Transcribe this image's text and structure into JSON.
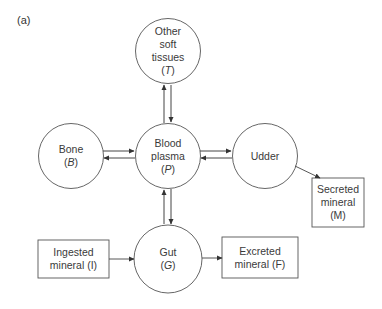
{
  "panel_label": "(a)",
  "compartments": {
    "tissues": {
      "lines": [
        "Other",
        "soft",
        "tissues"
      ],
      "symbol": "T"
    },
    "bone": {
      "lines": [
        "Bone"
      ],
      "symbol": "B"
    },
    "plasma": {
      "lines": [
        "Blood",
        "plasma"
      ],
      "symbol": "P"
    },
    "udder": {
      "lines": [
        "Udder"
      ],
      "symbol": ""
    },
    "gut": {
      "lines": [
        "Gut"
      ],
      "symbol": "G"
    }
  },
  "boxes": {
    "secreted": {
      "lines": [
        "Secreted",
        "mineral",
        "(M)"
      ]
    },
    "ingested": {
      "lines": [
        "Ingested",
        "mineral (I)"
      ]
    },
    "excreted": {
      "lines": [
        "Excreted",
        "mineral (F)"
      ]
    }
  },
  "colors": {
    "stroke": "#555555",
    "fill": "#ffffff",
    "text": "#3a3a3a"
  }
}
